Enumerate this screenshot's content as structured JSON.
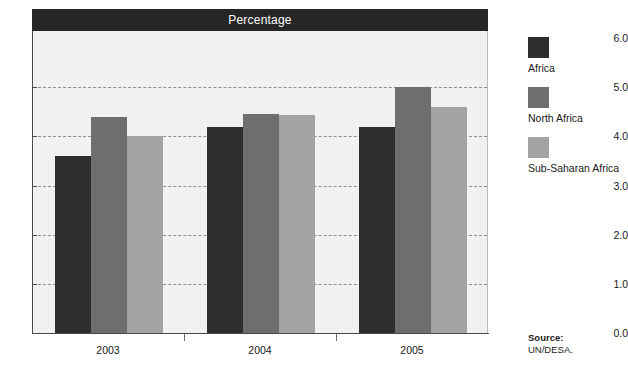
{
  "chart_data": {
    "type": "bar",
    "title": "Percentage",
    "xlabel": "",
    "ylabel": "",
    "categories": [
      "2003",
      "2004",
      "2005"
    ],
    "series": [
      {
        "name": "Africa",
        "color": "#2e2e2e",
        "values": [
          3.6,
          4.2,
          4.18
        ]
      },
      {
        "name": "North Africa",
        "color": "#6e6e6e",
        "values": [
          4.4,
          4.45,
          5.0
        ]
      },
      {
        "name": "Sub-Saharan Africa",
        "color": "#a3a3a3",
        "values": [
          4.0,
          4.43,
          4.6
        ]
      }
    ],
    "ylim": [
      0.0,
      6.0
    ],
    "ytick_labels": [
      "0.0",
      "1.0",
      "2.0",
      "3.0",
      "4.0",
      "5.0",
      "6.0"
    ],
    "ytick_values": [
      0.0,
      1.0,
      2.0,
      3.0,
      4.0,
      5.0,
      6.0
    ],
    "gridline_values": [
      1.0,
      2.0,
      3.0,
      4.0,
      5.0
    ],
    "grid": true,
    "legend_position": "right"
  },
  "source": {
    "label": "Source:",
    "value": "UN/DESA."
  }
}
